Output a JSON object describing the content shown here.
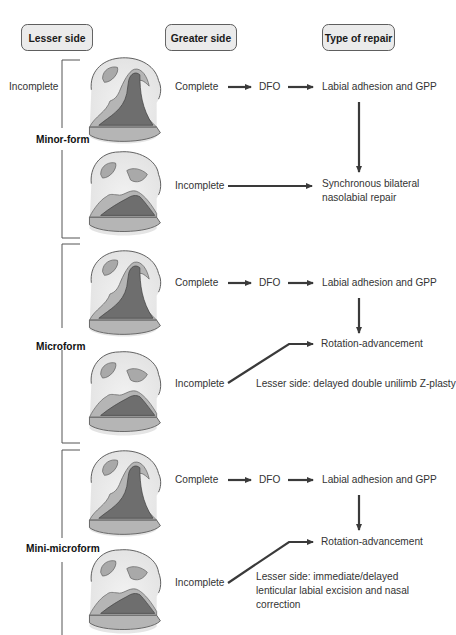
{
  "headers": {
    "lesser": "Lesser side",
    "greater": "Greater side",
    "repair": "Type of repair"
  },
  "sections": [
    {
      "form": "Minor-form",
      "lesser_side": "Incomplete",
      "rows": [
        {
          "greater_side": "Complete",
          "mid": "DFO",
          "repair": "Labial adhesion and GPP"
        },
        {
          "greater_side": "Incomplete",
          "repair": "Synchronous bilateral nasolabial repair"
        }
      ]
    },
    {
      "form": "Microform",
      "rows": [
        {
          "greater_side": "Complete",
          "mid": "DFO",
          "repair": "Labial adhesion and GPP"
        },
        {
          "greater_side": "Incomplete",
          "repair": "Rotation-advancement",
          "note": "Lesser side: delayed double unilimb Z-plasty"
        }
      ]
    },
    {
      "form": "Mini-microform",
      "rows": [
        {
          "greater_side": "Complete",
          "mid": "DFO",
          "repair": "Labial adhesion and GPP"
        },
        {
          "greater_side": "Incomplete",
          "repair": "Rotation-advancement",
          "note": "Lesser side: immediate/delayed lenticular labial excision and nasal correction"
        }
      ]
    }
  ],
  "colors": {
    "header_fill": "#ebebeb",
    "skin": "#e8e8e8",
    "nostril": "#a9a9a9",
    "lip_mid": "#b5b5b5",
    "cleft_dark": "#6e6e6e",
    "arrow": "#3a3a3a"
  },
  "icons": {
    "arrow": "right-arrow",
    "down_arrow": "down-arrow",
    "face": "nasolabial-illustration"
  }
}
